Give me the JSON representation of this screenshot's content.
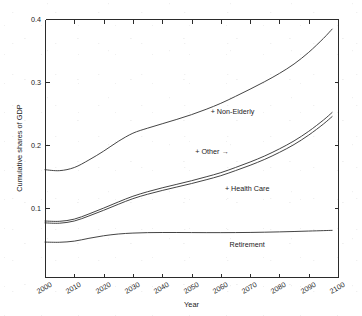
{
  "chart_data": {
    "type": "line",
    "title": "",
    "xlabel": "Year",
    "ylabel": "Cumulative shares of GDP",
    "xlim": [
      2000,
      2100
    ],
    "ylim": [
      -0.01,
      0.4
    ],
    "grid": false,
    "legend_position": "inline-annotations",
    "xticks": [
      2000,
      2010,
      2020,
      2030,
      2040,
      2050,
      2060,
      2070,
      2080,
      2090,
      2100
    ],
    "xtick_labels": [
      "2000",
      "2010",
      "2020",
      "2030",
      "2040",
      "2050",
      "2060",
      "2070",
      "2080",
      "2090",
      "2100"
    ],
    "yticks": [
      0.1,
      0.2,
      0.3,
      0.4
    ],
    "ytick_labels": [
      "0.1",
      "0.2",
      "0.3",
      "0.4"
    ],
    "x": [
      2000,
      2005,
      2010,
      2015,
      2020,
      2025,
      2030,
      2035,
      2040,
      2045,
      2050,
      2055,
      2060,
      2065,
      2070,
      2075,
      2080,
      2085,
      2090,
      2095,
      2098
    ],
    "series": [
      {
        "name": "Retirement",
        "label": "Retirement",
        "label_x": 2069,
        "label_y": 0.038,
        "values": [
          0.0455,
          0.0452,
          0.047,
          0.0515,
          0.0555,
          0.0583,
          0.0598,
          0.0605,
          0.0607,
          0.0607,
          0.0606,
          0.0605,
          0.0605,
          0.0606,
          0.0608,
          0.0612,
          0.0617,
          0.0623,
          0.063,
          0.0637,
          0.0641
        ]
      },
      {
        "name": "+ Health Care",
        "label": "+ Health Care",
        "label_x": 2069,
        "label_y": 0.126,
        "values": [
          0.076,
          0.0755,
          0.079,
          0.087,
          0.096,
          0.1055,
          0.1145,
          0.1215,
          0.1275,
          0.133,
          0.1385,
          0.1445,
          0.151,
          0.159,
          0.1675,
          0.177,
          0.188,
          0.2005,
          0.2155,
          0.233,
          0.245
        ]
      },
      {
        "name": "+ Other",
        "label": "+ Other →",
        "label_x": 2057,
        "label_y": 0.186,
        "values": [
          0.079,
          0.0785,
          0.082,
          0.0902,
          0.0995,
          0.1092,
          0.1183,
          0.1255,
          0.1317,
          0.1373,
          0.143,
          0.1492,
          0.1558,
          0.164,
          0.1727,
          0.1824,
          0.1936,
          0.2063,
          0.2215,
          0.2393,
          0.2515
        ]
      },
      {
        "name": "+ Non-Elderly",
        "label": "+ Non-Elderly",
        "label_x": 2064,
        "label_y": 0.249,
        "values": [
          0.1605,
          0.159,
          0.164,
          0.176,
          0.19,
          0.2055,
          0.2185,
          0.2265,
          0.2335,
          0.2405,
          0.248,
          0.2565,
          0.266,
          0.277,
          0.2885,
          0.3005,
          0.3135,
          0.3285,
          0.347,
          0.369,
          0.384
        ]
      }
    ]
  },
  "layout": {
    "plot_left": 45,
    "plot_right": 338,
    "plot_top": 19,
    "plot_bottom": 277
  }
}
